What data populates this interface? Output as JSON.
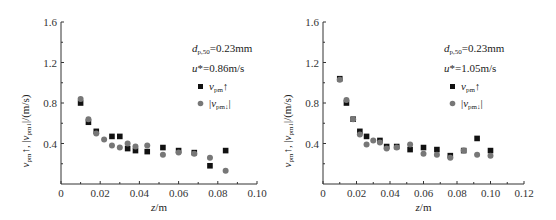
{
  "chart_data": [
    {
      "type": "scatter",
      "title": "",
      "xlabel": "z/m",
      "ylabel": "v_pm↑, |v_pm↓|/(m/s)",
      "xlim": [
        0,
        0.1
      ],
      "ylim": [
        0,
        1.6
      ],
      "xticks": [
        "0",
        "0.02",
        "0.04",
        "0.06",
        "0.08",
        "0.10"
      ],
      "yticks": [
        "0.4",
        "0.8",
        "1.2",
        "1.6"
      ],
      "annotations": [
        "d_p,50=0.23mm",
        "u*=0.86m/s"
      ],
      "legend": [
        "v_pm↑",
        "|v_pm↓|"
      ],
      "series": [
        {
          "name": "v_pm↑",
          "marker": "square",
          "color": "#111111",
          "x": [
            0.01,
            0.014,
            0.018,
            0.026,
            0.03,
            0.034,
            0.038,
            0.044,
            0.052,
            0.06,
            0.068,
            0.076,
            0.084
          ],
          "y": [
            0.8,
            0.61,
            0.52,
            0.47,
            0.47,
            0.35,
            0.33,
            0.32,
            0.36,
            0.33,
            0.31,
            0.18,
            0.33
          ]
        },
        {
          "name": "|v_pm↓|",
          "marker": "circle",
          "color": "#777777",
          "x": [
            0.01,
            0.014,
            0.018,
            0.022,
            0.026,
            0.03,
            0.034,
            0.038,
            0.044,
            0.052,
            0.06,
            0.068,
            0.076,
            0.084
          ],
          "y": [
            0.84,
            0.64,
            0.5,
            0.44,
            0.38,
            0.36,
            0.4,
            0.37,
            0.38,
            0.29,
            0.31,
            0.3,
            0.26,
            0.13
          ]
        }
      ]
    },
    {
      "type": "scatter",
      "title": "",
      "xlabel": "z/m",
      "ylabel": "v_pm↑, |v_pm↓|/(m/s)",
      "xlim": [
        0,
        0.12
      ],
      "ylim": [
        0,
        1.6
      ],
      "xticks": [
        "0",
        "0.02",
        "0.04",
        "0.06",
        "0.08",
        "0.10",
        "0.12"
      ],
      "yticks": [
        "0.4",
        "0.8",
        "1.2",
        "1.6"
      ],
      "annotations": [
        "d_p,50=0.23mm",
        "u*=1.05m/s"
      ],
      "legend": [
        "v_pm↑",
        "|v_pm↓|"
      ],
      "series": [
        {
          "name": "v_pm↑",
          "marker": "square",
          "color": "#111111",
          "x": [
            0.01,
            0.014,
            0.018,
            0.022,
            0.026,
            0.034,
            0.038,
            0.044,
            0.052,
            0.06,
            0.068,
            0.076,
            0.084,
            0.092,
            0.1
          ],
          "y": [
            1.04,
            0.8,
            0.64,
            0.52,
            0.47,
            0.43,
            0.37,
            0.37,
            0.34,
            0.36,
            0.34,
            0.28,
            0.33,
            0.45,
            0.33
          ]
        },
        {
          "name": "|v_pm↓|",
          "marker": "circle",
          "color": "#777777",
          "x": [
            0.01,
            0.014,
            0.018,
            0.022,
            0.026,
            0.03,
            0.034,
            0.038,
            0.044,
            0.052,
            0.06,
            0.068,
            0.076,
            0.084,
            0.092,
            0.1
          ],
          "y": [
            1.03,
            0.83,
            0.64,
            0.49,
            0.39,
            0.43,
            0.41,
            0.35,
            0.36,
            0.39,
            0.3,
            0.29,
            0.26,
            0.33,
            0.29,
            0.28
          ]
        }
      ]
    }
  ]
}
